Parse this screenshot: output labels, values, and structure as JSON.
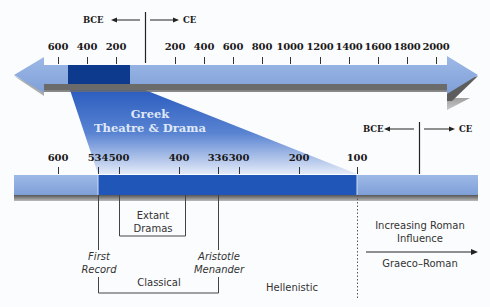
{
  "top_timeline": {
    "direction_labels": {
      "bce": "BCE",
      "ce": "CE"
    },
    "ticks": [
      {
        "label": "600",
        "x": 58
      },
      {
        "label": "400",
        "x": 87
      },
      {
        "label": "200",
        "x": 116
      },
      {
        "label": "200",
        "x": 175
      },
      {
        "label": "400",
        "x": 204
      },
      {
        "label": "600",
        "x": 233
      },
      {
        "label": "800",
        "x": 262
      },
      {
        "label": "1000",
        "x": 290
      },
      {
        "label": "1200",
        "x": 320
      },
      {
        "label": "1400",
        "x": 349
      },
      {
        "label": "1600",
        "x": 378
      },
      {
        "label": "1800",
        "x": 407
      },
      {
        "label": "2000",
        "x": 436
      }
    ],
    "highlight_range": {
      "start": "~534 BCE",
      "end": "~100 BCE"
    }
  },
  "zoom_callout": {
    "title_line1": "Greek",
    "title_line2": "Theatre & Drama"
  },
  "bottom_timeline": {
    "direction_labels": {
      "bce": "BCE",
      "ce": "CE"
    },
    "ticks": [
      {
        "label": "600",
        "x": 58
      },
      {
        "label": "534",
        "x": 98
      },
      {
        "label": "500",
        "x": 119
      },
      {
        "label": "400",
        "x": 179
      },
      {
        "label": "336",
        "x": 218
      },
      {
        "label": "300",
        "x": 239
      },
      {
        "label": "200",
        "x": 299
      },
      {
        "label": "100",
        "x": 357
      }
    ]
  },
  "annotations": {
    "extant_dramas": {
      "line1": "Extant",
      "line2": "Dramas"
    },
    "first_record": {
      "line1": "First",
      "line2": "Record"
    },
    "aristotle_menander": {
      "line1": "Aristotle",
      "line2": "Menander"
    },
    "classical": "Classical",
    "hellenistic": "Hellenistic",
    "roman_influence": {
      "line1": "Increasing Roman",
      "line2": "Influence"
    },
    "graeco_roman": "Graeco–Roman"
  },
  "colors": {
    "light_bar": "#8faee0",
    "dark_top_block": "#0d3a8c",
    "dark_bottom_block": "#1f56b8",
    "shadow": "#6a6a6a",
    "callout_top": "#2a5fc0",
    "callout_bottom": "#e8eef9"
  }
}
